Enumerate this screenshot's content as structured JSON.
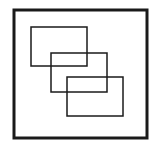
{
  "diagram": {
    "colors": {
      "stroke": "#1a1a1a",
      "background": "#ffffff"
    },
    "frame": {
      "x": 14,
      "y": 10,
      "width": 133,
      "height": 128,
      "stroke_width": 3
    },
    "rectangles": [
      {
        "x": 31,
        "y": 27,
        "width": 56,
        "height": 39,
        "stroke_width": 1.5
      },
      {
        "x": 51,
        "y": 53,
        "width": 56,
        "height": 39,
        "stroke_width": 1.5
      },
      {
        "x": 67,
        "y": 77,
        "width": 56,
        "height": 39,
        "stroke_width": 1.5
      }
    ]
  }
}
